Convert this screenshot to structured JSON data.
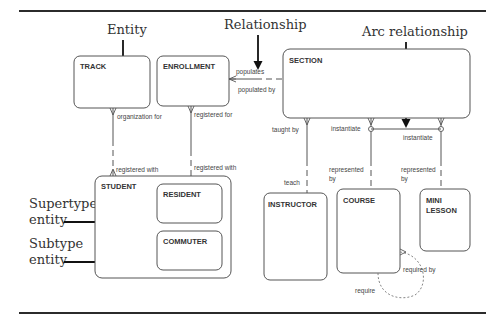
{
  "diagram": {
    "type": "entity-relationship diagram",
    "callouts": {
      "entity": "Entity",
      "relationship": "Relationship",
      "arc_relationship": "Arc relationship",
      "supertype_line1": "Supertype",
      "supertype_line2": "entity",
      "subtype_line1": "Subtype",
      "subtype_line2": "entity"
    },
    "entities": {
      "track": "TRACK",
      "enrollment": "ENROLLMENT",
      "section": "SECTION",
      "student": "STUDENT",
      "resident": "RESIDENT",
      "commuter": "COMMUTER",
      "instructor": "INSTRUCTOR",
      "course": "COURSE",
      "mini_lesson_line1": "MINI",
      "mini_lesson_line2": "LESSON"
    },
    "relationships": {
      "enrollment_section_populates": "populates",
      "enrollment_section_populated_by": "populated by",
      "track_student_organization_for": "organization for",
      "track_student_registered_with": "registered with",
      "enrollment_student_registered_for": "registered for",
      "enrollment_student_registered_with": "registered with",
      "section_instructor_taught_by": "taught by",
      "section_instructor_teach": "teach",
      "section_course_instantiate": "instantiate",
      "section_course_represented_line1": "represented",
      "section_course_represented_line2": "by",
      "section_minilesson_instantiate": "instantiate",
      "section_minilesson_represented_line1": "represented",
      "section_minilesson_represented_line2": "by",
      "course_required_by": "required by",
      "course_require": "require"
    }
  }
}
